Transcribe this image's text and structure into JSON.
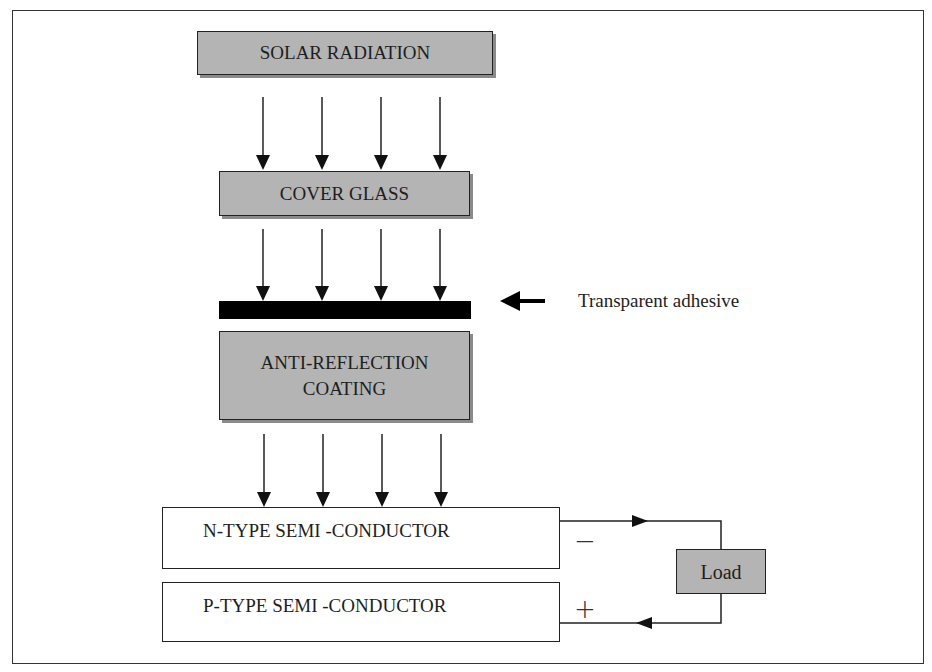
{
  "diagram": {
    "layers": [
      {
        "id": "solar",
        "label": "SOLAR RADIATION"
      },
      {
        "id": "cover",
        "label": "COVER GLASS"
      },
      {
        "id": "adhesive",
        "label": "Transparent adhesive"
      },
      {
        "id": "antireflection",
        "label_line1": "ANTI-REFLECTION",
        "label_line2": "COATING"
      },
      {
        "id": "ntype",
        "label": "N-TYPE SEMI -CONDUCTOR"
      },
      {
        "id": "ptype",
        "label": "P-TYPE SEMI -CONDUCTOR"
      }
    ],
    "load": {
      "label": "Load"
    },
    "terminals": {
      "negative": "−",
      "positive": "+"
    },
    "colors": {
      "box_fill": "#b4b4b4",
      "box_border": "#222222",
      "shadow": "#8a8a8a",
      "adhesive": "#000000",
      "background": "#ffffff"
    },
    "arrow_groups": [
      {
        "from": "SOLAR RADIATION",
        "to": "COVER GLASS",
        "count": 4
      },
      {
        "from": "COVER GLASS",
        "to": "Transparent adhesive",
        "count": 4
      },
      {
        "from": "ANTI-REFLECTION COATING",
        "to": "N-TYPE SEMI -CONDUCTOR",
        "count": 4
      }
    ]
  }
}
